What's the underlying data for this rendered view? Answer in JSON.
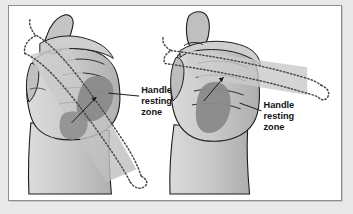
{
  "figure": {
    "background": "#ffffff",
    "border_color": "#8d8d93",
    "page_background": "#e9e9e9"
  },
  "palette": {
    "skin_light": "#d0d0d0",
    "skin_mid": "#bcbcbc",
    "skin_shadow": "#a6a6a6",
    "zone_dark": "#8a8a8a",
    "handle_band": "#c4c4c4",
    "outline": "#1b1b1b",
    "dotted": "#4a4a4a",
    "text": "#141414"
  },
  "labels": [
    {
      "id": "left-label",
      "lines": [
        "Handle",
        "resting",
        "zone"
      ],
      "x": 133,
      "y": 96,
      "leader_from": [
        131,
        94
      ],
      "leader_to": [
        100,
        88
      ]
    },
    {
      "id": "right-label",
      "lines": [
        "Handle",
        "resting",
        "zone"
      ],
      "x": 256,
      "y": 111,
      "leader_from": [
        254,
        109
      ],
      "leader_to": [
        232,
        98
      ]
    }
  ],
  "hands": [
    {
      "id": "left-hand",
      "caption": "Left view — hand gripping handle, handle axis angled steeply across palm",
      "thumb": "raised, pointing up-left",
      "zone_shape": "rounded patch on palm below fingers",
      "handle": "dotted outline crossing diagonally from upper-left to lower-right"
    },
    {
      "id": "right-hand",
      "caption": "Right view — hand gripping handle, handle axis nearly horizontal",
      "thumb": "raised, pointing up",
      "zone_shape": "elongated vertical oval on palm",
      "handle": "dotted outline crossing horizontally to the right"
    }
  ]
}
